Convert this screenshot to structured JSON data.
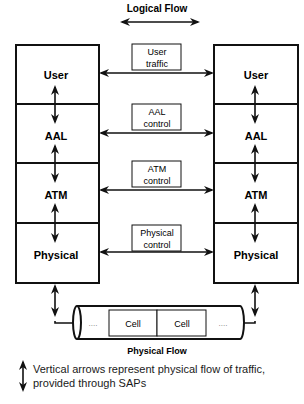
{
  "title": "Logical Flow",
  "footer_title": "Physical Flow",
  "stack_left": {
    "layers": [
      "User",
      "AAL",
      "ATM",
      "Physical"
    ]
  },
  "stack_right": {
    "layers": [
      "User",
      "AAL",
      "ATM",
      "Physical"
    ]
  },
  "flows": [
    {
      "line1": "User",
      "line2": "traffic"
    },
    {
      "line1": "AAL",
      "line2": "control"
    },
    {
      "line1": "ATM",
      "line2": "control"
    },
    {
      "line1": "Physical",
      "line2": "control"
    }
  ],
  "pipe": {
    "left_dots": "....",
    "cells": [
      "Cell",
      "Cell"
    ],
    "right_dots": "...."
  },
  "legend": {
    "line1": "Vertical arrows represent physical flow of traffic,",
    "line2": "provided through SAPs"
  },
  "colors": {
    "line": "#111111",
    "background": "#ffffff"
  }
}
